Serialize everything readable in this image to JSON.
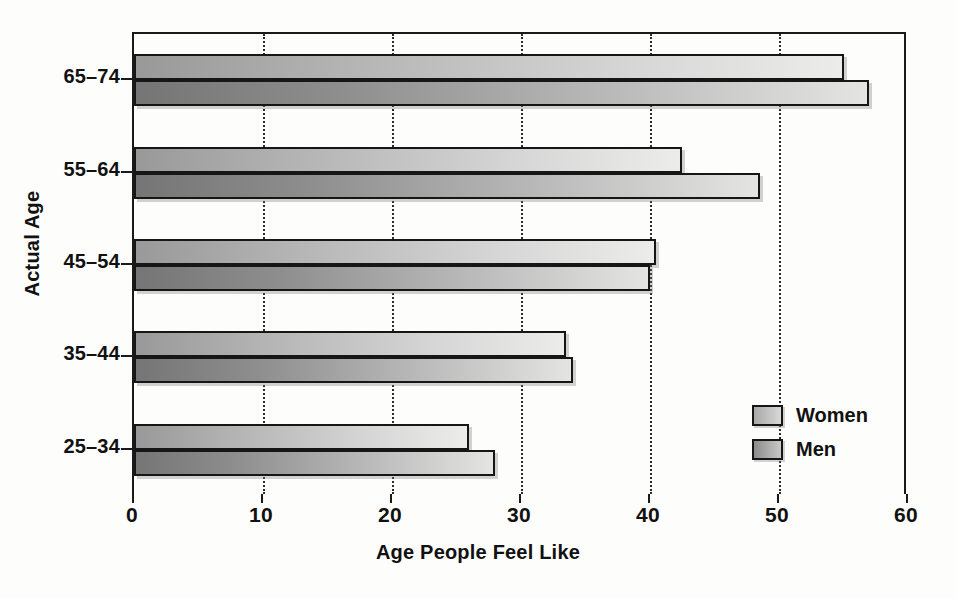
{
  "chart_data": {
    "type": "bar",
    "orientation": "horizontal",
    "title": "",
    "xlabel": "Age People Feel Like",
    "ylabel": "Actual Age",
    "categories": [
      "25–34",
      "35–44",
      "45–54",
      "55–64",
      "65–74"
    ],
    "series": [
      {
        "name": "Women",
        "values": [
          26,
          33.5,
          40.5,
          42.5,
          55
        ]
      },
      {
        "name": "Men",
        "values": [
          28,
          34,
          40,
          48.5,
          57
        ]
      }
    ],
    "xlim": [
      0,
      60
    ],
    "xticks": [
      0,
      10,
      20,
      30,
      40,
      50,
      60
    ],
    "xtick_labels": [
      "0",
      "10",
      "20",
      "30",
      "40",
      "50",
      "60"
    ],
    "grid": "vertical-dotted",
    "legend_position": "center-right-inside",
    "legend_entries": [
      "Women",
      "Men"
    ],
    "colors": {
      "women_gradient_start": "#999999",
      "women_gradient_end": "#ececeb",
      "men_gradient_start": "#757575",
      "men_gradient_end": "#e4e4e3",
      "bar_border": "#161616",
      "axis": "#1a1a1a",
      "background": "#fdfdfb",
      "text": "#111111"
    }
  }
}
